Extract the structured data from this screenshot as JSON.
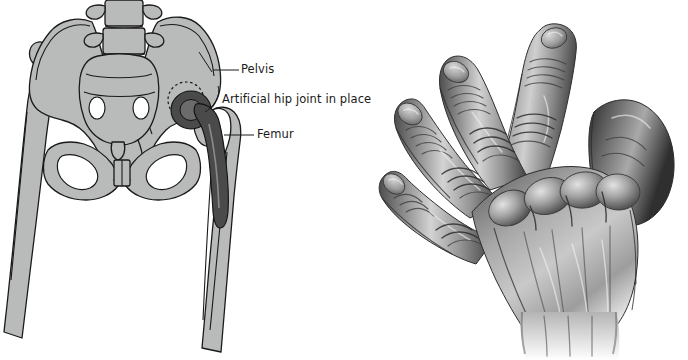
{
  "figure": {
    "background_color": "#ffffff",
    "width": 688,
    "height": 360
  },
  "colors": {
    "bone_fill": "#b9bbbb",
    "bone_outline": "#1a1a1a",
    "prosthesis_fill": "#4a4a4a",
    "prosthesis_outline": "#111111",
    "label_text": "#1a1a1a",
    "leader_line": "#1a1a1a",
    "skin_light": "#e8e8e8",
    "skin_mid": "#9a9a9a",
    "skin_dark": "#4f4f4f"
  },
  "hip_panel": {
    "name": "hip-replacement-diagram",
    "labels": [
      {
        "id": "pelvis",
        "text": "Pelvis"
      },
      {
        "id": "artificial",
        "text": "Artificial hip joint in place"
      },
      {
        "id": "femur",
        "text": "Femur"
      }
    ],
    "anatomy": [
      "lumbar-vertebrae",
      "sacrum",
      "left-ilium",
      "right-ilium",
      "left-obturator-foramen",
      "right-obturator-foramen",
      "pubic-symphysis",
      "left-femur",
      "right-femur"
    ],
    "implant": {
      "acetabular-cup": "dark prosthetic cup seated in right acetabulum",
      "femoral-head": "dark prosthetic ball",
      "femoral-stem": "long tapering stem inside right femoral shaft",
      "dashed-outline": "dashed circle marking original acetabulum"
    }
  },
  "hand_panel": {
    "name": "rheumatoid-arthritis-hand",
    "caption": "Hand with rheumatoid arthritis showing ulnar deviation and swollen knuckles",
    "features": [
      "swollen-metacarpophalangeal-joints",
      "ulnar-deviation-of-fingers",
      "thickened-proximal-interphalangeal-joints",
      "prominent-extensor-tendons",
      "thumb-abducted"
    ]
  }
}
